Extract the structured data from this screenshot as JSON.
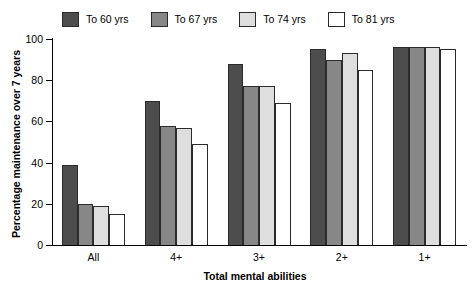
{
  "chart_data": {
    "type": "bar",
    "title": "",
    "xlabel": "Total mental abilities",
    "ylabel": "Percentage maintenance over 7 years",
    "categories": [
      "All",
      "4+",
      "3+",
      "2+",
      "1+"
    ],
    "series": [
      {
        "name": "To 60 yrs",
        "color": "#4d4d4d",
        "values": [
          39,
          70,
          88,
          95,
          96
        ]
      },
      {
        "name": "To 67 yrs",
        "color": "#878787",
        "values": [
          20,
          58,
          77,
          90,
          96
        ]
      },
      {
        "name": "To 74 yrs",
        "color": "#dedede",
        "values": [
          19,
          57,
          77,
          93,
          96
        ]
      },
      {
        "name": "To 81 yrs",
        "color": "#ffffff",
        "values": [
          15,
          49,
          69,
          85,
          95
        ]
      }
    ],
    "ylim": [
      0,
      100
    ],
    "yticks": [
      0,
      20,
      40,
      60,
      80,
      100
    ],
    "grid": false,
    "legend_position": "top"
  },
  "legend": {
    "items": [
      {
        "label": "To 60 yrs"
      },
      {
        "label": "To 67 yrs"
      },
      {
        "label": "To 74 yrs"
      },
      {
        "label": "To 81 yrs"
      }
    ]
  }
}
